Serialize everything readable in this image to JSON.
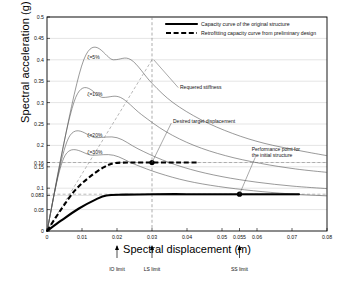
{
  "chart_data": {
    "type": "line",
    "title": "",
    "xlabel": "Spectral displacement (m)",
    "ylabel": "Spectral acceleration (g)",
    "xlim": [
      0,
      0.08
    ],
    "ylim": [
      0,
      0.5
    ],
    "grid": true,
    "legend_position": "top-right",
    "xticks": [
      {
        "value": 0,
        "label": "0"
      },
      {
        "value": 0.01,
        "label": "0.01"
      },
      {
        "value": 0.02,
        "label": "0.02"
      },
      {
        "value": 0.03,
        "label": "0.03"
      },
      {
        "value": 0.04,
        "label": "0.04"
      },
      {
        "value": 0.05,
        "label": "0.05"
      },
      {
        "value": 0.055,
        "label": "0.055"
      },
      {
        "value": 0.06,
        "label": "0.06"
      },
      {
        "value": 0.07,
        "label": "0.07"
      },
      {
        "value": 0.08,
        "label": "0.08"
      }
    ],
    "yticks": [
      {
        "value": 0,
        "label": "0"
      },
      {
        "value": 0.05,
        "label": "0.05"
      },
      {
        "value": 0.083,
        "label": "0.083"
      },
      {
        "value": 0.1,
        "label": "0.1"
      },
      {
        "value": 0.15,
        "label": "0.15"
      },
      {
        "value": 0.16,
        "label": "0.16"
      },
      {
        "value": 0.2,
        "label": "0.2"
      },
      {
        "value": 0.25,
        "label": "0.25"
      },
      {
        "value": 0.3,
        "label": "0.3"
      },
      {
        "value": 0.35,
        "label": "0.35"
      },
      {
        "value": 0.4,
        "label": "0.4"
      },
      {
        "value": 0.45,
        "label": "0.45"
      },
      {
        "value": 0.5,
        "label": "0.5"
      }
    ],
    "legend": [
      {
        "label": "Capacity curve of the original structure",
        "style": "solid-thick"
      },
      {
        "label": "Retrofitting capacity curve from preliminary design",
        "style": "dashed-thick"
      }
    ],
    "series": [
      {
        "name": "Capacity curve of the original structure",
        "style": "solid-thick",
        "points": [
          [
            0,
            0
          ],
          [
            0.004,
            0.024
          ],
          [
            0.009,
            0.052
          ],
          [
            0.014,
            0.074
          ],
          [
            0.017,
            0.083
          ],
          [
            0.022,
            0.085
          ],
          [
            0.03,
            0.086
          ],
          [
            0.04,
            0.086
          ],
          [
            0.05,
            0.086
          ],
          [
            0.055,
            0.086
          ],
          [
            0.065,
            0.086
          ],
          [
            0.072,
            0.086
          ]
        ]
      },
      {
        "name": "Retrofitting capacity curve from preliminary design",
        "style": "dashed-thick",
        "points": [
          [
            0,
            0
          ],
          [
            0.004,
            0.05
          ],
          [
            0.008,
            0.095
          ],
          [
            0.012,
            0.125
          ],
          [
            0.016,
            0.148
          ],
          [
            0.019,
            0.158
          ],
          [
            0.023,
            0.16
          ],
          [
            0.03,
            0.16
          ],
          [
            0.037,
            0.16
          ],
          [
            0.043,
            0.16
          ]
        ]
      },
      {
        "name": "Demand spectrum zeta=5%",
        "style": "thin-solid",
        "points": [
          [
            0,
            0
          ],
          [
            0.0105,
            0.4
          ],
          [
            0.019,
            0.4
          ],
          [
            0.024,
            0.4
          ],
          [
            0.03,
            0.345
          ],
          [
            0.036,
            0.3
          ],
          [
            0.044,
            0.26
          ],
          [
            0.053,
            0.228
          ],
          [
            0.062,
            0.205
          ],
          [
            0.072,
            0.188
          ],
          [
            0.08,
            0.176
          ]
        ]
      },
      {
        "name": "Demand spectrum zeta=10%",
        "style": "thin-solid",
        "points": [
          [
            0,
            0
          ],
          [
            0.0082,
            0.312
          ],
          [
            0.016,
            0.312
          ],
          [
            0.021,
            0.312
          ],
          [
            0.027,
            0.272
          ],
          [
            0.034,
            0.232
          ],
          [
            0.042,
            0.2
          ],
          [
            0.051,
            0.176
          ],
          [
            0.061,
            0.158
          ],
          [
            0.071,
            0.145
          ],
          [
            0.08,
            0.137
          ]
        ]
      },
      {
        "name": "Demand spectrum zeta=20%",
        "style": "thin-solid",
        "points": [
          [
            0,
            0
          ],
          [
            0.0062,
            0.218
          ],
          [
            0.014,
            0.218
          ],
          [
            0.02,
            0.218
          ],
          [
            0.026,
            0.192
          ],
          [
            0.033,
            0.166
          ],
          [
            0.041,
            0.144
          ],
          [
            0.05,
            0.127
          ],
          [
            0.06,
            0.114
          ],
          [
            0.07,
            0.105
          ],
          [
            0.08,
            0.099
          ]
        ]
      },
      {
        "name": "Demand spectrum zeta=30%",
        "style": "thin-solid",
        "points": [
          [
            0,
            0
          ],
          [
            0.0052,
            0.177
          ],
          [
            0.013,
            0.177
          ],
          [
            0.019,
            0.177
          ],
          [
            0.025,
            0.156
          ],
          [
            0.032,
            0.135
          ],
          [
            0.04,
            0.117
          ],
          [
            0.049,
            0.104
          ],
          [
            0.059,
            0.094
          ],
          [
            0.069,
            0.087
          ],
          [
            0.08,
            0.082
          ]
        ]
      },
      {
        "name": "Required stiffness line",
        "style": "thin-dashed",
        "points": [
          [
            0,
            0
          ],
          [
            0.03,
            0.4
          ]
        ]
      }
    ],
    "markers": [
      {
        "name": "desired-target-displacement",
        "x": 0.03,
        "y": 0.16
      },
      {
        "name": "performance-point-initial",
        "x": 0.055,
        "y": 0.086
      }
    ],
    "vertical_guides": [
      {
        "x": 0.03,
        "style": "dashed"
      }
    ],
    "horizontal_guides": [
      {
        "y": 0.16,
        "style": "dashed"
      },
      {
        "y": 0.086,
        "style": "dashed"
      }
    ],
    "damping_labels": [
      {
        "text": "ζ=5%",
        "x": 0.0115,
        "y": 0.4
      },
      {
        "text": "ζ=10%",
        "x": 0.0115,
        "y": 0.312
      },
      {
        "text": "ζ=20%",
        "x": 0.0115,
        "y": 0.218
      },
      {
        "text": "ζ=30%",
        "x": 0.0115,
        "y": 0.177
      }
    ],
    "annotations": [
      {
        "name": "required-stiffness",
        "text": "Requered stiffness",
        "x": 0.038,
        "y": 0.333
      },
      {
        "name": "desired-target-displacement",
        "text": "Desired target displacement",
        "x": 0.036,
        "y": 0.255
      },
      {
        "name": "performance-point-initial",
        "line1": "Performance point for",
        "line2": "the initial structure",
        "x": 0.0585,
        "y": 0.19
      }
    ],
    "limit_markers": [
      {
        "label": "IO limit",
        "x": 0.02
      },
      {
        "label": "LS limit",
        "x": 0.03
      },
      {
        "label": "SS limit",
        "x": 0.055
      }
    ],
    "colors": {
      "capacity_original": "#000000",
      "capacity_retrofit": "#000000",
      "demand_spectrum": "#555555",
      "guide": "#777777",
      "frame": "#000000",
      "grid": "#999999"
    }
  }
}
